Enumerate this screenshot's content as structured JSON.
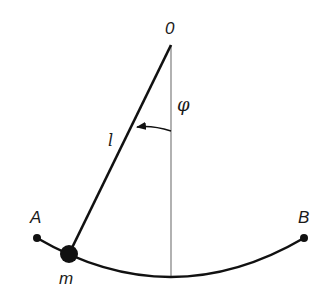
{
  "diagram": {
    "labels": {
      "pivot": "0",
      "angle": "φ",
      "length": "l",
      "left_extreme": "A",
      "right_extreme": "B",
      "mass": "m"
    },
    "geometry": {
      "pivot": [
        171,
        45
      ],
      "bob": [
        69,
        254
      ],
      "point_a": [
        37,
        238
      ],
      "point_b": [
        304,
        238
      ],
      "arc_bottom": [
        171,
        276
      ]
    },
    "colors": {
      "stroke": "#111111",
      "vertical_line": "#888888",
      "background": "#ffffff"
    }
  }
}
